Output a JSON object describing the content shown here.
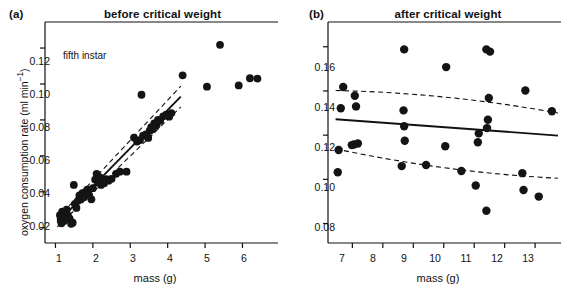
{
  "figure": {
    "panels": [
      {
        "tag": "(a)",
        "title": "before critical weight",
        "annotation": "fifth instar"
      },
      {
        "tag": "(b)",
        "title": "after critical weight",
        "annotation": ""
      }
    ]
  },
  "axes": {
    "ylabel_main": "oxygen consumption rate (ml min",
    "ylabel_exp": "−1",
    "ylabel_close": ")",
    "xlabel": "mass (g)"
  },
  "chart_data": [
    {
      "type": "scatter",
      "title": "before critical weight",
      "panel": "(a)",
      "xlabel": "mass (g)",
      "ylabel": "oxygen consumption rate (ml min−1)",
      "annotation": "fifth instar",
      "xlim": [
        0.72,
        6.95
      ],
      "ylim": [
        0.0115,
        0.1345
      ],
      "xticks": [
        1,
        2,
        3,
        4,
        5,
        6
      ],
      "yticks": [
        0.02,
        0.04,
        0.06,
        0.08,
        0.1,
        0.12
      ],
      "xtick_labels": [
        "1",
        "2",
        "3",
        "4",
        "5",
        "6"
      ],
      "ytick_labels": [
        "0.02",
        "0.04",
        "0.06",
        "0.08",
        "0.10",
        "0.12"
      ],
      "grid": false,
      "legend": "none",
      "points": [
        [
          1.12,
          0.027
        ],
        [
          1.14,
          0.0245
        ],
        [
          1.16,
          0.0225
        ],
        [
          1.18,
          0.029
        ],
        [
          1.2,
          0.0262
        ],
        [
          1.23,
          0.0238
        ],
        [
          1.3,
          0.03
        ],
        [
          1.33,
          0.0268
        ],
        [
          1.38,
          0.025
        ],
        [
          1.42,
          0.0222
        ],
        [
          1.46,
          0.0228
        ],
        [
          1.49,
          0.0438
        ],
        [
          1.52,
          0.0332
        ],
        [
          1.56,
          0.031
        ],
        [
          1.6,
          0.035
        ],
        [
          1.64,
          0.038
        ],
        [
          1.68,
          0.0358
        ],
        [
          1.72,
          0.0392
        ],
        [
          1.76,
          0.037
        ],
        [
          1.8,
          0.0398
        ],
        [
          1.85,
          0.0412
        ],
        [
          1.9,
          0.0382
        ],
        [
          1.96,
          0.0358
        ],
        [
          2.0,
          0.042
        ],
        [
          2.06,
          0.0468
        ],
        [
          2.1,
          0.05
        ],
        [
          2.14,
          0.0452
        ],
        [
          2.18,
          0.0482
        ],
        [
          2.22,
          0.0438
        ],
        [
          2.26,
          0.0462
        ],
        [
          2.3,
          0.0448
        ],
        [
          2.36,
          0.047
        ],
        [
          2.42,
          0.0462
        ],
        [
          2.5,
          0.0472
        ],
        [
          2.62,
          0.05
        ],
        [
          2.72,
          0.0512
        ],
        [
          2.9,
          0.0512
        ],
        [
          3.1,
          0.0702
        ],
        [
          3.18,
          0.068
        ],
        [
          3.26,
          0.0688
        ],
        [
          3.34,
          0.0712
        ],
        [
          3.42,
          0.072
        ],
        [
          3.48,
          0.07
        ],
        [
          3.52,
          0.074
        ],
        [
          3.56,
          0.076
        ],
        [
          3.6,
          0.0748
        ],
        [
          3.64,
          0.078
        ],
        [
          3.7,
          0.077
        ],
        [
          3.74,
          0.08
        ],
        [
          3.8,
          0.0795
        ],
        [
          3.88,
          0.082
        ],
        [
          3.96,
          0.083
        ],
        [
          4.04,
          0.0818
        ],
        [
          4.1,
          0.0838
        ],
        [
          3.3,
          0.094
        ],
        [
          4.4,
          0.1048
        ],
        [
          5.05,
          0.0985
        ],
        [
          5.4,
          0.1218
        ],
        [
          5.9,
          0.0992
        ],
        [
          6.2,
          0.1032
        ],
        [
          6.4,
          0.103
        ]
      ],
      "fit_line": {
        "x": [
          1.05,
          4.35
        ],
        "y": [
          0.0228,
          0.093
        ],
        "style": "solid"
      },
      "ci_upper": {
        "x": [
          1.05,
          4.35
        ],
        "y": [
          0.0252,
          0.0988
        ],
        "style": "dashed"
      },
      "ci_lower": {
        "x": [
          1.05,
          4.35
        ],
        "y": [
          0.0205,
          0.0872
        ],
        "style": "dashed"
      }
    },
    {
      "type": "scatter",
      "title": "after critical weight",
      "panel": "(b)",
      "xlabel": "mass (g)",
      "ylabel": "oxygen consumption rate (ml min−1)",
      "annotation": "",
      "xlim": [
        6.2,
        13.85
      ],
      "ylim": [
        0.0712,
        0.1712
      ],
      "xticks": [
        7,
        8,
        9,
        10,
        11,
        12,
        13
      ],
      "yticks": [
        0.08,
        0.1,
        0.12,
        0.14,
        0.16
      ],
      "xtick_labels": [
        "7",
        "8",
        "9",
        "10",
        "11",
        "12",
        "13"
      ],
      "ytick_labels": [
        "0.08",
        "0.10",
        "0.12",
        "0.14",
        "0.16"
      ],
      "grid": false,
      "legend": "none",
      "points": [
        [
          6.52,
          0.1032
        ],
        [
          6.55,
          0.1133
        ],
        [
          6.62,
          0.1322
        ],
        [
          6.7,
          0.1418
        ],
        [
          6.98,
          0.1155
        ],
        [
          7.05,
          0.1158
        ],
        [
          7.08,
          0.1378
        ],
        [
          7.12,
          0.133
        ],
        [
          7.18,
          0.1162
        ],
        [
          8.62,
          0.106
        ],
        [
          8.68,
          0.1312
        ],
        [
          8.7,
          0.124
        ],
        [
          8.72,
          0.1175
        ],
        [
          8.7,
          0.1588
        ],
        [
          9.42,
          0.1065
        ],
        [
          10.05,
          0.115
        ],
        [
          10.08,
          0.1508
        ],
        [
          10.58,
          0.1038
        ],
        [
          11.05,
          0.0972
        ],
        [
          11.12,
          0.1168
        ],
        [
          11.15,
          0.1208
        ],
        [
          11.4,
          0.0858
        ],
        [
          11.42,
          0.1232
        ],
        [
          11.45,
          0.127
        ],
        [
          11.4,
          0.1588
        ],
        [
          11.48,
          0.1368
        ],
        [
          11.52,
          0.1578
        ],
        [
          12.58,
          0.1028
        ],
        [
          12.62,
          0.0952
        ],
        [
          12.68,
          0.1402
        ],
        [
          13.12,
          0.0922
        ],
        [
          13.55,
          0.1308
        ]
      ],
      "fit_line": {
        "x": [
          6.45,
          13.75
        ],
        "y": [
          0.1272,
          0.1198
        ],
        "style": "solid"
      },
      "ci_upper": {
        "x": [
          6.45,
          13.75
        ],
        "y": [
          0.1402,
          0.13
        ],
        "style": "dashed"
      },
      "ci_lower": {
        "x": [
          6.45,
          13.75
        ],
        "y": [
          0.1138,
          0.1005
        ],
        "style": "dashed"
      }
    }
  ]
}
